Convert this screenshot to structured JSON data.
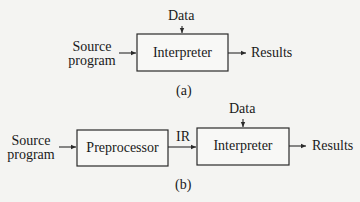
{
  "diagram_a": {
    "caption": "(a)",
    "input_label_line1": "Source",
    "input_label_line2": "program",
    "data_label": "Data",
    "interpreter_label": "Interpreter",
    "output_label": "Results"
  },
  "diagram_b": {
    "caption": "(b)",
    "input_label_line1": "Source",
    "input_label_line2": "program",
    "preprocessor_label": "Preprocessor",
    "ir_label": "IR",
    "data_label": "Data",
    "interpreter_label": "Interpreter",
    "output_label": "Results"
  },
  "colors": {
    "background": "#f4f4f2",
    "stroke": "#2a2a2a",
    "box_fill": "#f8f8f6"
  }
}
